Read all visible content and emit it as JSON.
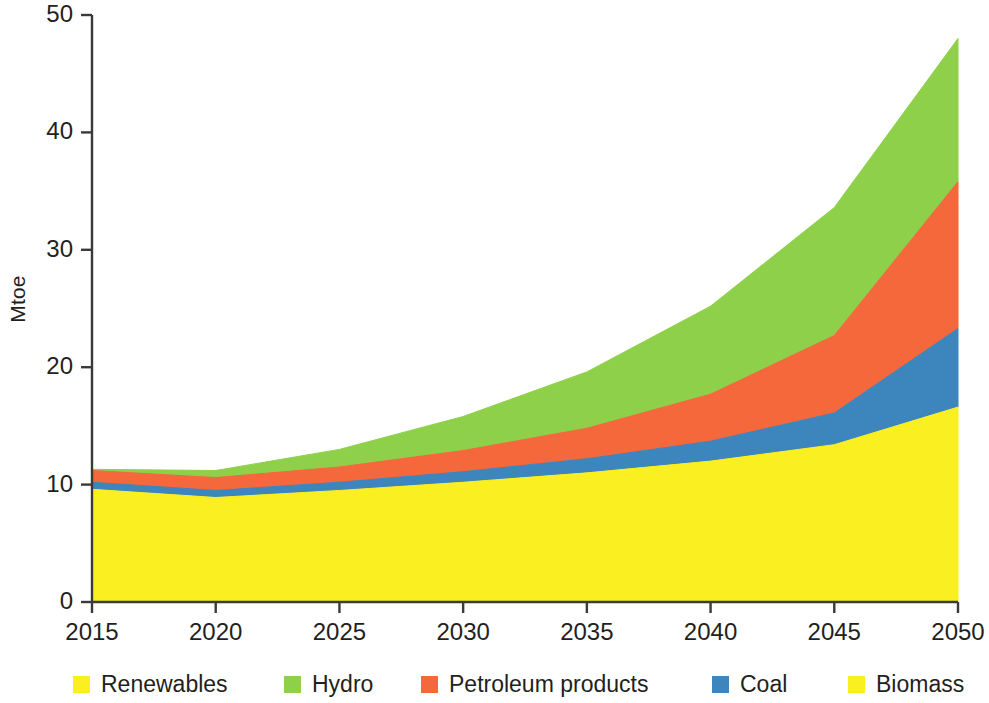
{
  "chart_data": {
    "type": "area",
    "stacked": true,
    "title": "",
    "subtitle": "",
    "xlabel": "",
    "ylabel": "Mtoe",
    "xlim": [
      2015,
      2050
    ],
    "ylim": [
      0,
      50
    ],
    "grid": false,
    "legend_position": "bottom",
    "x": [
      2015,
      2020,
      2025,
      2030,
      2035,
      2040,
      2045,
      2050
    ],
    "xtick_labels": [
      "2015",
      "2020",
      "2025",
      "2030",
      "2035",
      "2040",
      "2045",
      "2050"
    ],
    "ytick_labels": [
      "0",
      "10",
      "20",
      "30",
      "40",
      "50"
    ],
    "ytick_values": [
      0,
      10,
      20,
      30,
      40,
      50
    ],
    "series": [
      {
        "name": "Biomass",
        "color": "#faf021",
        "values": [
          9.6,
          8.9,
          9.5,
          10.2,
          11.0,
          12.0,
          13.4,
          16.6
        ]
      },
      {
        "name": "Coal",
        "color": "#3d85bd",
        "values": [
          0.6,
          0.6,
          0.7,
          0.9,
          1.2,
          1.7,
          2.7,
          6.7
        ]
      },
      {
        "name": "Petroleum products",
        "color": "#f4683c",
        "values": [
          1.0,
          1.1,
          1.3,
          1.8,
          2.6,
          4.0,
          6.6,
          12.5
        ]
      },
      {
        "name": "Hydro",
        "color": "#8ed04a",
        "values": [
          0.1,
          0.6,
          1.5,
          2.9,
          4.8,
          7.5,
          10.9,
          12.2
        ]
      }
    ],
    "stack_tops": {
      "biomass": [
        9.6,
        8.9,
        9.5,
        10.2,
        11.0,
        12.0,
        13.4,
        16.6
      ],
      "coal": [
        10.2,
        9.5,
        10.2,
        11.1,
        12.2,
        13.7,
        16.1,
        23.3
      ],
      "petroleum": [
        11.2,
        10.6,
        11.5,
        12.9,
        14.8,
        17.7,
        22.7,
        35.8
      ],
      "hydro": [
        11.3,
        11.2,
        13.0,
        15.8,
        19.6,
        25.2,
        33.6,
        48.0
      ]
    },
    "legend_entries": [
      {
        "label": "Renewables",
        "color": "#faf021"
      },
      {
        "label": "Hydro",
        "color": "#8ed04a"
      },
      {
        "label": "Petroleum products",
        "color": "#f4683c"
      },
      {
        "label": "Coal",
        "color": "#3d85bd"
      },
      {
        "label": "Biomass",
        "color": "#faf021"
      }
    ],
    "axis_color": "#3a3a38"
  }
}
